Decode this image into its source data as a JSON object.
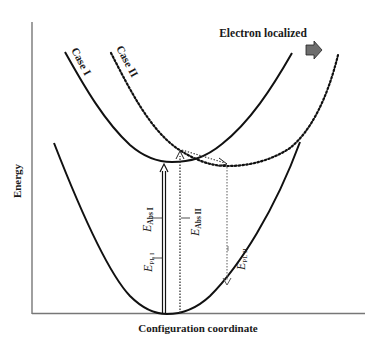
{
  "diagram": {
    "type": "configuration-coordinate-diagram",
    "axes": {
      "x_label": "Configuration coordinate",
      "y_label": "Energy"
    },
    "annotation": {
      "text": "Electron localized",
      "arrow_icon": "right-arrow-icon",
      "arrow_color": "#6e6e6e"
    },
    "curves": [
      {
        "id": "ground",
        "label": "",
        "style": "solid"
      },
      {
        "id": "case-1",
        "label": "Case I",
        "style": "solid"
      },
      {
        "id": "case-2",
        "label": "Case II",
        "style": "dotted"
      }
    ],
    "transitions": [
      {
        "id": "abs-1",
        "symbol": "E",
        "subscript": "Abs I",
        "style": "solid-double",
        "direction": "up"
      },
      {
        "id": "abs-2",
        "symbol": "E",
        "subscript": "Abs II",
        "style": "dotted",
        "direction": "up"
      },
      {
        "id": "pl-1",
        "symbol": "E",
        "subscript": "PL I",
        "style": "solid-double",
        "direction": "down"
      },
      {
        "id": "pl-2",
        "symbol": "E",
        "subscript": "PL II",
        "style": "dotted",
        "direction": "down"
      }
    ]
  }
}
